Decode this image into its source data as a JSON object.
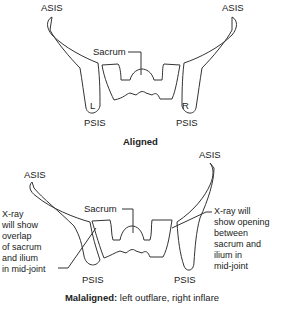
{
  "aligned": {
    "asis_left": "ASIS",
    "asis_right": "ASIS",
    "sacrum": "Sacrum",
    "left_marker": "L",
    "right_marker": "R",
    "psis_left": "PSIS",
    "psis_right": "PSIS",
    "caption": "Aligned"
  },
  "malaligned": {
    "asis_left": "ASIS",
    "asis_right": "ASIS",
    "sacrum": "Sacrum",
    "psis_left": "PSIS",
    "psis_right": "PSIS",
    "left_note": [
      "X-ray",
      "will show",
      "overlap",
      "of sacrum",
      "and ilium",
      "in mid-joint"
    ],
    "right_note": [
      "X-ray will",
      "show opening",
      "between",
      "sacrum and",
      "ilium in",
      "mid-joint"
    ],
    "caption_bold": "Malaligned:",
    "caption_rest": " left outflare, right inflare"
  }
}
